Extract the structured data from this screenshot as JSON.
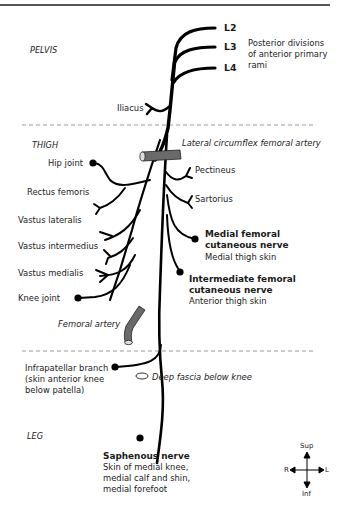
{
  "diagram": {
    "regions": {
      "pelvis": "PELVIS",
      "thigh": "THIGH",
      "leg": "LEG"
    },
    "roots": {
      "l2": "L2",
      "l3": "L3",
      "l4": "L4",
      "description_line1": "Posterior divisions",
      "description_line2": "of anterior primary",
      "description_line3": "rami"
    },
    "pelvic_branch": "Iliacus",
    "arteries": {
      "lateral_circumflex": "Lateral circumflex femoral artery",
      "femoral": "Femoral artery"
    },
    "left_branches": {
      "hip_joint": "Hip joint",
      "rectus_femoris": "Rectus femoris",
      "vastus_lateralis": "Vastus lateralis",
      "vastus_intermedius": "Vastus intermedius",
      "vastus_medialis": "Vastus medialis",
      "knee_joint": "Knee joint"
    },
    "right_branches": {
      "pectineus": "Pectineus",
      "sartorius": "Sartorius",
      "medial_cutaneous_line1": "Medial femoral",
      "medial_cutaneous_line2": "cutaneous nerve",
      "medial_cutaneous_desc": "Medial thigh skin",
      "intermediate_cutaneous_line1": "Intermediate femoral",
      "intermediate_cutaneous_line2": "cutaneous nerve",
      "intermediate_cutaneous_desc": "Anterior thigh skin"
    },
    "infrapatellar": {
      "line1": "Infrapatellar branch",
      "line2": "(skin anterior knee",
      "line3": "below patella)"
    },
    "deep_fascia": "Deep fascia below knee",
    "saphenous": {
      "name": "Saphenous nerve",
      "line1": "Skin of medial knee,",
      "line2": "medial calf and shin,",
      "line3": "medial forefoot"
    },
    "compass": {
      "sup": "Sup",
      "inf": "Inf",
      "right": "R",
      "left": "L"
    }
  },
  "colors": {
    "nerve": "#000000",
    "artery": "#666666",
    "divider": "#9a9a9a",
    "text": "#1a1a1a"
  }
}
